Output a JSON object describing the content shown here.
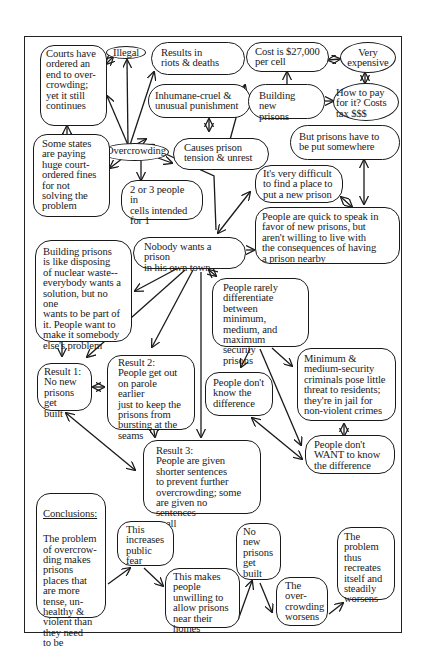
{
  "diagram": {
    "type": "concept-map",
    "topic": "Prison overcrowding",
    "nodes": {
      "courts": "Courts have\nordered an\nend to over-\ncrowding;\nyet it still\ncontinues",
      "illegal": "Illegal",
      "riots": "Results in\nriots & deaths",
      "inhumane": "Inhumane-cruel &\nunusual punishment",
      "overcrowding": "Overcrowding",
      "fines": "Some states\nare paying\nhuge court-\nordered fines\nfor not\nsolving the\nproblem",
      "tension": "Causes prison\ntension & unrest",
      "cells": "2 or 3 people in\ncells intended\nfor 1",
      "cost": "Cost is $27,000\nper cell",
      "expensive": "Very\nexpensive",
      "building": "Building new\nprisons",
      "howtopay": "How to pay\nfor it? Costs\ntax $$$",
      "somewhere": "But prisons have to\nbe put somewhere",
      "difficult": "It's very difficult\nto find a place to\nput a new prison",
      "quick": "People are quick to speak in\nfavor of new prisons, but\naren't willing to live with\nthe consequences of having\na prison nearby",
      "nobody": "Nobody wants a prison\nin his own town",
      "nuclear": "Building prisons\nis like disposing\nof nuclear waste--\neverybody wants a\nsolution, but no one\nwants to be part of\nit.  People want to\nmake it somebody\nelse's problem",
      "differentiate": "People rarely\ndifferentiate\nbetween minimum,\nmedium, and\nmaximum security\nprisons",
      "minimum": "Minimum &\nmedium-security\ncriminals pose little\nthreat to residents;\nthey're in jail for\nnon-violent crimes",
      "dontknow": "People don't\nknow the\ndifference",
      "dontwant": "People don't\nWANT to know\nthe difference",
      "result1": "Result 1:\nNo new\nprisons get\nbuilt",
      "result2": "Result 2:\nPeople get out\non parole earlier\njust to keep the\nprisons from\nbursting at the\nseams",
      "result3": "Result 3:\nPeople are given\nshorter sentences\nto prevent further\novercrowding; some\nare given no sentences\nat all",
      "conclusions_heading": "Conclusions:",
      "conclusions": "The problem\nof overcrow-\nding makes\nprisons\nplaces that\nare more\ntense, un-\nhealthy &\nviolent than\nthey need\nto be",
      "fear": "This\nincreases\npublic\nfear",
      "unwilling": "This makes\npeople\nunwilling to\nallow prisons\nnear their\nhomes",
      "nonew": "No new\nprisons\nget\nbuilt",
      "worsens": "The\nover-\ncrowding\nworsens",
      "recreates": "The\nproblem\nthus\nrecreates\nitself and\nsteadily\nworsens"
    },
    "colors": {
      "ink": "#1a1a1a",
      "background": "#ffffff"
    }
  }
}
